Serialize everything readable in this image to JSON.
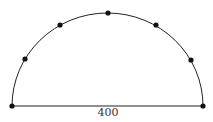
{
  "diagram": {
    "type": "semicircle",
    "diameter_label": "400",
    "colors": {
      "stroke": "#222222",
      "point": "#111111",
      "text": "#333333"
    },
    "points_count": 7,
    "arc_points_count": 5
  }
}
